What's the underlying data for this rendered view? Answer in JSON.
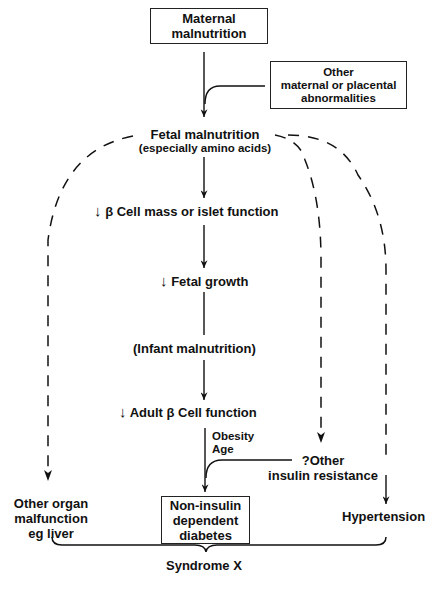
{
  "diagram": {
    "nodes": {
      "maternal_malnutrition": {
        "line1": "Maternal",
        "line2": "malnutrition"
      },
      "other_maternal": {
        "line1": "Other",
        "line2": "maternal or placental",
        "line3": "abnormalities"
      },
      "fetal_malnutrition": {
        "line1": "Fetal malnutrition",
        "line2": "(especially amino acids)"
      },
      "beta_cell_mass": {
        "arrow": "↓",
        "text": "β Cell mass or islet function"
      },
      "fetal_growth": {
        "arrow": "↓",
        "text": "Fetal growth"
      },
      "infant_malnutrition": {
        "text": "(Infant malnutrition)"
      },
      "adult_beta_cell": {
        "arrow": "↓",
        "text": "Adult β Cell function"
      },
      "obesity_age": {
        "line1": "Obesity",
        "line2": "Age"
      },
      "other_insulin_resistance": {
        "line1": "?Other",
        "line2": "insulin resistance"
      },
      "other_organ": {
        "line1": "Other organ",
        "line2": "malfunction",
        "line3": "eg liver"
      },
      "niddm": {
        "line1": "Non-insulin",
        "line2": "dependent",
        "line3": "diabetes"
      },
      "hypertension": {
        "text": "Hypertension"
      },
      "syndrome_x": {
        "text": "Syndrome X"
      }
    },
    "edges": [
      {
        "from": "Maternal malnutrition",
        "to": "Fetal malnutrition",
        "style": "solid"
      },
      {
        "from": "Other maternal or placental abnormalities",
        "to": "Fetal malnutrition",
        "style": "solid"
      },
      {
        "from": "Fetal malnutrition",
        "to": "β Cell mass or islet function",
        "style": "solid"
      },
      {
        "from": "β Cell mass or islet function",
        "to": "Fetal growth",
        "style": "solid"
      },
      {
        "from": "Fetal growth",
        "to": "Infant malnutrition",
        "style": "solid"
      },
      {
        "from": "Infant malnutrition",
        "to": "Adult β Cell function",
        "style": "solid"
      },
      {
        "from": "Adult β Cell function",
        "to": "Non-insulin dependent diabetes",
        "style": "solid"
      },
      {
        "from": "?Other insulin resistance",
        "to": "Non-insulin dependent diabetes",
        "style": "solid"
      },
      {
        "from": "Fetal malnutrition",
        "to": "Other organ malfunction eg liver",
        "style": "dashed"
      },
      {
        "from": "Fetal malnutrition",
        "to": "?Other insulin resistance",
        "style": "dashed"
      },
      {
        "from": "Fetal malnutrition",
        "to": "Hypertension",
        "style": "dashed"
      },
      {
        "from": "?Other insulin resistance",
        "to": "Hypertension",
        "style": "solid"
      }
    ]
  }
}
